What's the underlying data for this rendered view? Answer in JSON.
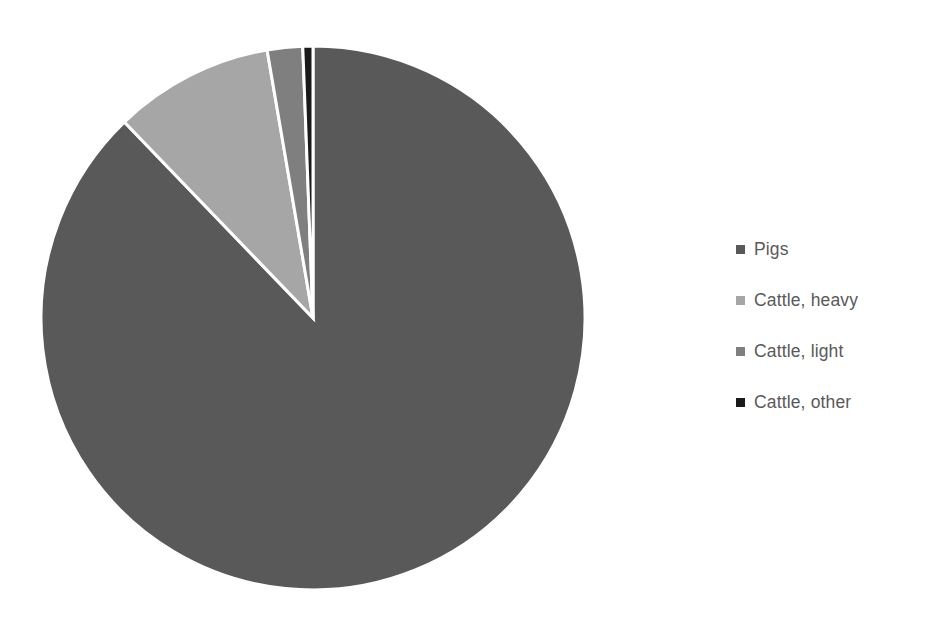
{
  "chart": {
    "title": "",
    "background_color": "#FFFFFF"
  },
  "chart_data": {
    "type": "pie",
    "title": "",
    "categories": [
      "Pigs",
      "Cattle, heavy",
      "Cattle, light",
      "Cattle, other"
    ],
    "values": [
      87.8,
      9.5,
      2.1,
      0.6
    ],
    "colors": [
      "#595959",
      "#A6A6A6",
      "#7F7F7F",
      "#1A1A1A"
    ],
    "start_angle_deg": 0,
    "direction": "counterclockwise-from-top",
    "slice_border_color": "#FFFFFF",
    "slice_border_width": 3,
    "legend_position": "right",
    "grid": false,
    "data_labels": false,
    "slices": [
      {
        "label": "Pigs",
        "value": 87.8,
        "color": "#595959"
      },
      {
        "label": "Cattle, heavy",
        "value": 9.5,
        "color": "#A6A6A6"
      },
      {
        "label": "Cattle, light",
        "value": 2.1,
        "color": "#7F7F7F"
      },
      {
        "label": "Cattle, other",
        "value": 0.6,
        "color": "#1A1A1A"
      }
    ]
  },
  "legend": {
    "items": [
      {
        "label": "Pigs",
        "marker_color": "#595959"
      },
      {
        "label": "Cattle, heavy",
        "marker_color": "#A6A6A6"
      },
      {
        "label": "Cattle, light",
        "marker_color": "#7F7F7F"
      },
      {
        "label": "Cattle, other",
        "marker_color": "#1A1A1A"
      }
    ]
  },
  "geometry": {
    "center_x": 313,
    "center_y": 318,
    "radius": 272
  }
}
